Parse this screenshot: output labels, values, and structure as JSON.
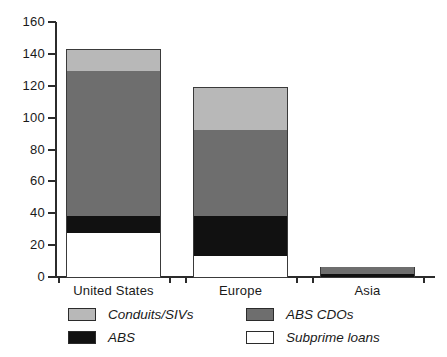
{
  "chart_data": {
    "type": "bar",
    "stacked": true,
    "title": "",
    "xlabel": "",
    "ylabel": "",
    "categories": [
      "United States",
      "Europe",
      "Asia"
    ],
    "series": [
      {
        "name": "Subprime loans",
        "color": "#ffffff",
        "values": [
          28,
          14,
          0
        ]
      },
      {
        "name": "ABS",
        "color": "#111111",
        "values": [
          11,
          25,
          2.5
        ]
      },
      {
        "name": "ABS CDOs",
        "color": "#6e6e6e",
        "values": [
          91,
          54,
          4.5
        ]
      },
      {
        "name": "Conduits/SIVs",
        "color": "#b8b8b8",
        "values": [
          14,
          27,
          0
        ]
      }
    ],
    "totals": [
      144,
      120,
      7
    ],
    "cumulative": {
      "United States": {
        "Subprime loans": 28,
        "ABS": 39,
        "ABS CDOs": 130,
        "Conduits/SIVs": 144
      },
      "Europe": {
        "Subprime loans": 14,
        "ABS": 39,
        "ABS CDOs": 93,
        "Conduits/SIVs": 120
      },
      "Asia": {
        "Subprime loans": 0,
        "ABS": 2.5,
        "ABS CDOs": 7,
        "Conduits/SIVs": 7
      }
    },
    "ylim": [
      0,
      160
    ],
    "yticks": [
      0,
      20,
      40,
      60,
      80,
      100,
      120,
      140,
      160
    ],
    "ytick_labels": [
      "0",
      "20",
      "40",
      "60",
      "80",
      "100",
      "120",
      "140",
      "160"
    ],
    "grid": false,
    "legend_position": "bottom",
    "legend_entries": [
      "Conduits/SIVs",
      "ABS CDOs",
      "ABS",
      "Subprime loans"
    ]
  },
  "axis": {
    "y_ticks": [
      {
        "label": "160",
        "value": 160
      },
      {
        "label": "140",
        "value": 140
      },
      {
        "label": "120",
        "value": 120
      },
      {
        "label": "100",
        "value": 100
      },
      {
        "label": "80",
        "value": 80
      },
      {
        "label": "60",
        "value": 60
      },
      {
        "label": "40",
        "value": 40
      },
      {
        "label": "20",
        "value": 20
      },
      {
        "label": "0",
        "value": 0
      }
    ]
  },
  "categories": [
    {
      "label": "United States"
    },
    {
      "label": "Europe"
    },
    {
      "label": "Asia"
    }
  ],
  "legend": [
    {
      "label": "Conduits/SIVs",
      "color": "#b8b8b8"
    },
    {
      "label": "ABS CDOs",
      "color": "#6e6e6e"
    },
    {
      "label": "ABS",
      "color": "#111111"
    },
    {
      "label": "Subprime loans",
      "color": "#ffffff"
    }
  ],
  "colors": {
    "conduits_sivs": "#b8b8b8",
    "abs_cdos": "#6e6e6e",
    "abs": "#111111",
    "subprime_loans": "#ffffff",
    "axis": "#2b2b2b",
    "background": "#ffffff"
  }
}
